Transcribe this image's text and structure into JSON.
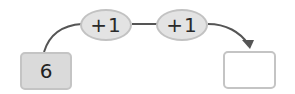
{
  "diagram": {
    "start_value": "6",
    "steps": [
      {
        "label": "+1"
      },
      {
        "label": "+1"
      }
    ],
    "answer_value": "",
    "colors": {
      "start_fill": "#dadada",
      "oval_fill": "#e3e3e3",
      "border": "#c4c4c4",
      "arrow": "#555555"
    }
  }
}
